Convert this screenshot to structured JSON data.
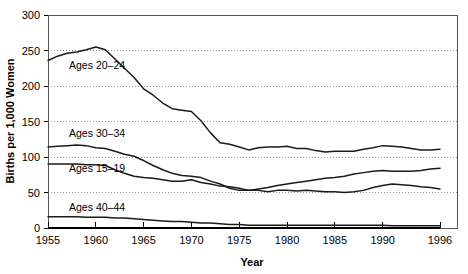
{
  "chart_data": {
    "type": "line",
    "title": "",
    "xlabel": "Year",
    "ylabel": "Births per 1,000 Women",
    "xlim": [
      1955,
      1996
    ],
    "ylim": [
      0,
      300
    ],
    "ytick_values": [
      0,
      50,
      100,
      150,
      200,
      250,
      300
    ],
    "ytick_labels": [
      "0",
      "50",
      "100",
      "150",
      "200",
      "250",
      "300"
    ],
    "xtick_values": [
      1955,
      1960,
      1965,
      1970,
      1975,
      1980,
      1985,
      1990,
      1996
    ],
    "xtick_labels": [
      "1955",
      "1960",
      "1965",
      "1970",
      "1975",
      "1980",
      "1985",
      "1990",
      "1996"
    ],
    "grid": "horizontal-dotted",
    "legend": "inline-labels",
    "line_color": "#1a1a1a",
    "grid_color": "#8c8c8c",
    "axis_color": "#000000",
    "x": [
      1955,
      1956,
      1957,
      1958,
      1959,
      1960,
      1961,
      1962,
      1963,
      1964,
      1965,
      1966,
      1967,
      1968,
      1969,
      1970,
      1971,
      1972,
      1973,
      1974,
      1975,
      1976,
      1977,
      1978,
      1979,
      1980,
      1981,
      1982,
      1983,
      1984,
      1985,
      1986,
      1987,
      1988,
      1989,
      1990,
      1991,
      1992,
      1993,
      1994,
      1995,
      1996
    ],
    "series": [
      {
        "name": "Ages 20-24",
        "label": "Ages 20–24",
        "label_x": 1957.2,
        "label_y": 224,
        "values": [
          236,
          242,
          246,
          248,
          251,
          255,
          251,
          238,
          225,
          212,
          196,
          187,
          176,
          168,
          166,
          164,
          151,
          134,
          120,
          118,
          114,
          110,
          113,
          114,
          114,
          115,
          112,
          112,
          109,
          107,
          108,
          108,
          108,
          111,
          113,
          116,
          115,
          114,
          112,
          110,
          110,
          111
        ]
      },
      {
        "name": "Ages 30-34",
        "label": "Ages 30–34",
        "label_x": 1957.2,
        "label_y": 128,
        "values": [
          114,
          115,
          116,
          117,
          116,
          113,
          112,
          108,
          104,
          101,
          95,
          88,
          82,
          77,
          74,
          73,
          71,
          66,
          62,
          56,
          53,
          53,
          55,
          57,
          60,
          62,
          64,
          66,
          68,
          70,
          71,
          73,
          76,
          78,
          80,
          81,
          80,
          80,
          80,
          81,
          83,
          84
        ]
      },
      {
        "name": "Ages 15-19",
        "label": "Ages 15–19",
        "label_x": 1957.2,
        "label_y": 79,
        "values": [
          90,
          90,
          90,
          90,
          89,
          89,
          88,
          82,
          77,
          73,
          71,
          70,
          68,
          66,
          66,
          68,
          64,
          62,
          59,
          58,
          56,
          53,
          53,
          51,
          53,
          53,
          52,
          53,
          52,
          51,
          51,
          50,
          51,
          53,
          57,
          60,
          62,
          61,
          60,
          58,
          57,
          55
        ]
      },
      {
        "name": "Ages 40-44",
        "label": "Ages 40–44",
        "label_x": 1957.2,
        "label_y": 24,
        "values": [
          16,
          16,
          16,
          16,
          15,
          15,
          15,
          14,
          14,
          13,
          12,
          11,
          10,
          9,
          9,
          8,
          7,
          7,
          6,
          5,
          5,
          4,
          4,
          4,
          4,
          4,
          4,
          4,
          4,
          4,
          4,
          4,
          4,
          4,
          4,
          4,
          3,
          3,
          3,
          3,
          3,
          3
        ]
      }
    ]
  },
  "plot": {
    "left": 48,
    "right": 457,
    "top": 15,
    "bottom": 228,
    "data_right_x": 440
  }
}
